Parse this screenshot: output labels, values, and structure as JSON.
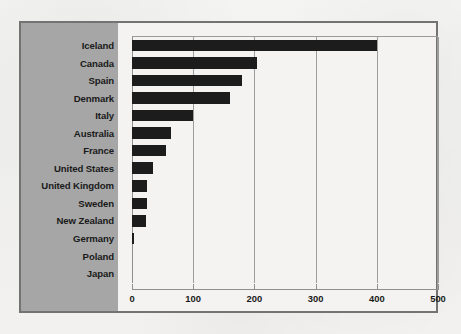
{
  "chart_data": {
    "type": "bar",
    "orientation": "horizontal",
    "title": "",
    "subtitle": "",
    "xlabel": "",
    "ylabel": "",
    "xlim": [
      0,
      500
    ],
    "ylim": null,
    "grid": true,
    "legend": false,
    "legend_position": "none",
    "xticks": [
      "0",
      "100",
      "200",
      "300",
      "400",
      "500"
    ],
    "xtick_values": [
      0,
      100,
      200,
      300,
      400,
      500
    ],
    "categories": [
      "Iceland",
      "Canada",
      "Spain",
      "Denmark",
      "Italy",
      "Australia",
      "France",
      "United States",
      "United Kingdom",
      "Sweden",
      "New Zealand",
      "Germany",
      "Poland",
      "Japan"
    ],
    "values": [
      400,
      205,
      180,
      160,
      100,
      63,
      55,
      35,
      25,
      25,
      23,
      3,
      0,
      0
    ],
    "series": [
      {
        "name": "value",
        "values": [
          400,
          205,
          180,
          160,
          100,
          63,
          55,
          35,
          25,
          25,
          23,
          3,
          0,
          0
        ]
      }
    ]
  },
  "style": {
    "bar_color": "#1c1c1c",
    "label_panel_color": "#a6a6a6",
    "plot_background": "#f4f3f1",
    "page_background": "#f2f1ef",
    "frame_color": "#737373",
    "gridline_color": "#9d9d9d",
    "axis_color": "#8f8f8f",
    "text_color": "#1a1a1a"
  }
}
